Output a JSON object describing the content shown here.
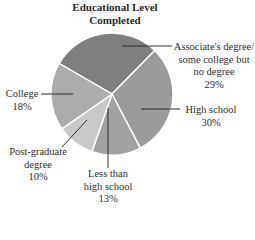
{
  "chart_data": {
    "type": "pie",
    "title": "Educational Level Completed",
    "title_lines": [
      "Educational Level",
      "Completed"
    ],
    "slices": [
      {
        "label": "Associate's degree/ some college but no degree",
        "label_lines": [
          "Associate's degree/",
          "some college but",
          "no degree"
        ],
        "value": 29,
        "pct_label": "29%",
        "color": "#7f7f7f"
      },
      {
        "label": "High school",
        "label_lines": [
          "High school"
        ],
        "value": 30,
        "pct_label": "30%",
        "color": "#9b9b9b"
      },
      {
        "label": "Less than high school",
        "label_lines": [
          "Less than",
          "high school"
        ],
        "value": 13,
        "pct_label": "13%",
        "color": "#a2a2a2"
      },
      {
        "label": "Post-graduate degree",
        "label_lines": [
          "Post-graduate",
          "degree"
        ],
        "value": 10,
        "pct_label": "10%",
        "color": "#c9c9c9"
      },
      {
        "label": "College",
        "label_lines": [
          "College"
        ],
        "value": 18,
        "pct_label": "18%",
        "color": "#acacac"
      }
    ],
    "categories": [
      "Associate's degree/some college but no degree",
      "High school",
      "Less than high school",
      "Post-graduate degree",
      "College"
    ],
    "values": [
      29,
      30,
      13,
      10,
      18
    ],
    "legend": "none (leader-line labels)",
    "unit": "%"
  }
}
